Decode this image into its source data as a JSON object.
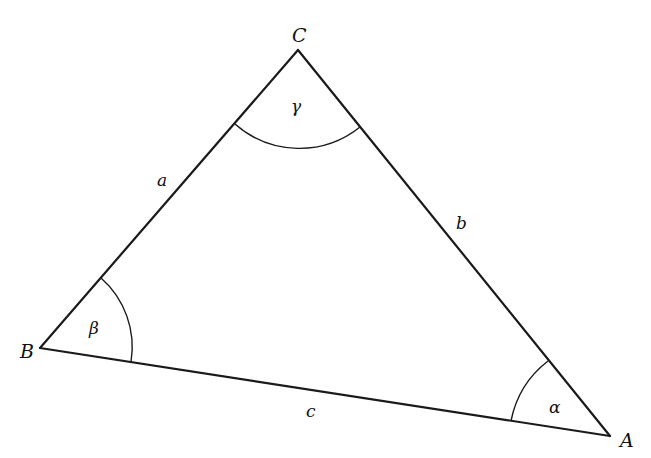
{
  "figure": {
    "type": "triangle",
    "vertices": [
      {
        "id": "C",
        "label": "C",
        "x": 298,
        "y": 50
      },
      {
        "id": "B",
        "label": "B",
        "x": 40,
        "y": 348
      },
      {
        "id": "A",
        "label": "A",
        "x": 610,
        "y": 436
      }
    ],
    "sides": [
      {
        "id": "a",
        "label": "a",
        "from": "B",
        "to": "C"
      },
      {
        "id": "b",
        "label": "b",
        "from": "C",
        "to": "A"
      },
      {
        "id": "c",
        "label": "c",
        "from": "B",
        "to": "A"
      }
    ],
    "angles": [
      {
        "id": "gamma",
        "label": "γ",
        "at": "C"
      },
      {
        "id": "beta",
        "label": "β",
        "at": "B"
      },
      {
        "id": "alpha",
        "label": "α",
        "at": "A"
      }
    ]
  }
}
